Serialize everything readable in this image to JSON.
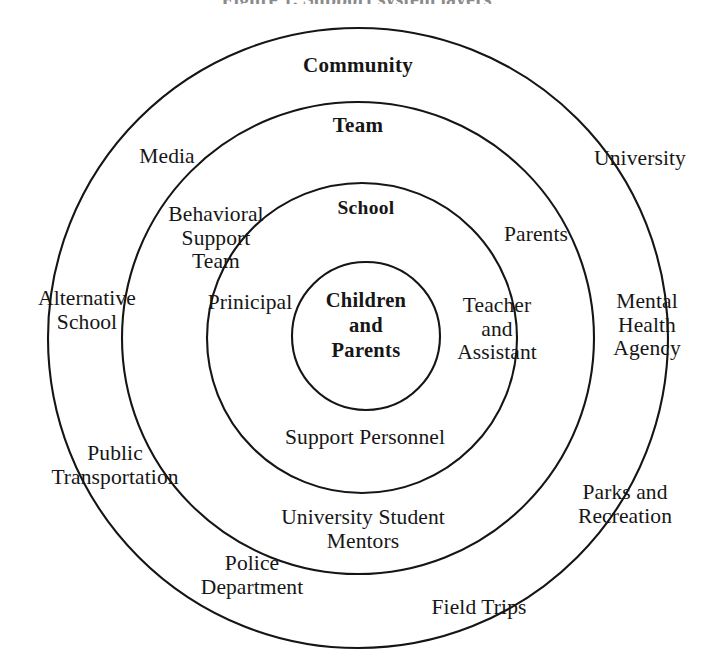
{
  "figure": {
    "cut_off_heading": "Figure 1.  Support system layers",
    "center_x": 358,
    "center_y": 338
  },
  "rings": [
    {
      "id": "community",
      "title": "Community",
      "radius": 310,
      "title_x": 358,
      "title_y": 66
    },
    {
      "id": "team",
      "title": "Team",
      "radius": 236,
      "title_x": 358,
      "title_y": 126
    },
    {
      "id": "school",
      "title": "School",
      "radius": 155,
      "title_x": 366,
      "title_y": 208
    },
    {
      "id": "core",
      "title": "Children\nand\nParents",
      "radius": 74,
      "title_x": 366,
      "title_y": 325
    }
  ],
  "members": {
    "school": [
      {
        "id": "prinicipal",
        "text": "Prinicipal",
        "x": 250,
        "y": 302
      },
      {
        "id": "teacher-and-assistant",
        "text": "Teacher\nand\nAssistant",
        "x": 497,
        "y": 329
      },
      {
        "id": "support-personnel",
        "text": "Support Personnel",
        "x": 365,
        "y": 437
      }
    ],
    "team": [
      {
        "id": "behavioral-support-team",
        "text": "Behavioral\nSupport\nTeam",
        "x": 216,
        "y": 238
      },
      {
        "id": "parents",
        "text": "Parents",
        "x": 536,
        "y": 234
      },
      {
        "id": "university-student-mentors",
        "text": "University Student\nMentors",
        "x": 363,
        "y": 530
      }
    ],
    "community": [
      {
        "id": "media",
        "text": "Media",
        "x": 167,
        "y": 156
      },
      {
        "id": "university",
        "text": "University",
        "x": 790,
        "y": 158
      },
      {
        "id": "alternative-school",
        "text": "Alternative\nSchool",
        "x": 87,
        "y": 311
      },
      {
        "id": "mental-health-agency",
        "text": "Mental\nHealth\nAgency",
        "x": 647,
        "y": 325
      },
      {
        "id": "public-transportation",
        "text": "Public\nTransportation",
        "x": 115,
        "y": 466
      },
      {
        "id": "parks-and-recreation",
        "text": "Parks and\nRecreation",
        "x": 625,
        "y": 505
      },
      {
        "id": "police-department",
        "text": "Police\nDepartment",
        "x": 252,
        "y": 576
      },
      {
        "id": "field-trips",
        "text": "Field Trips",
        "x": 479,
        "y": 607
      }
    ]
  },
  "style": {
    "stroke_color": "#151515",
    "background": "#ffffff",
    "text_color": "#161616"
  }
}
